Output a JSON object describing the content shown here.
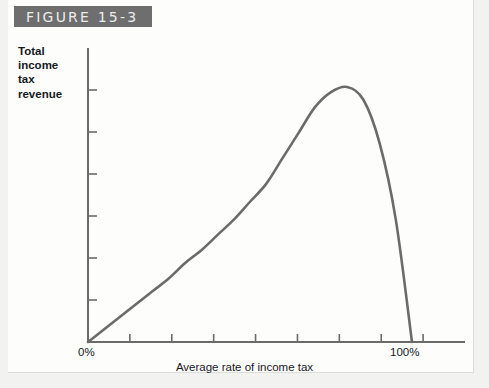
{
  "figure": {
    "banner_label": "FIGURE 15-3"
  },
  "axes": {
    "y_caption_lines": [
      "Total",
      "income",
      "tax",
      "revenue"
    ],
    "x_caption": "Average rate of income tax",
    "x_tick_labels": {
      "start": "0%",
      "end": "100%"
    }
  },
  "colors": {
    "banner_bg": "#6e6e6e",
    "banner_text": "#ececeb",
    "curve": "#6b6b6b",
    "axis": "#6b6b6b",
    "page_bg": "#f2f2f0",
    "plate_bg": "#fdfdfc",
    "text": "#15181c"
  },
  "chart_data": {
    "type": "line",
    "title": "FIGURE 15-3",
    "xlabel": "Average rate of income tax",
    "ylabel": "Total income tax revenue",
    "xlim": [
      0,
      100
    ],
    "ylim": [
      0,
      100
    ],
    "grid": false,
    "legend": null,
    "x_tick_labels": [
      "0%",
      "100%"
    ],
    "y_tick_labels": [],
    "n_x_ticks": 8,
    "n_y_ticks": 6,
    "annotations": [],
    "series": [
      {
        "name": "Total income tax revenue",
        "x": [
          0,
          5,
          10,
          15,
          20,
          25,
          30,
          35,
          40,
          45,
          50,
          55,
          60,
          65,
          70,
          75,
          80,
          85,
          90,
          95,
          100
        ],
        "y": [
          0,
          5,
          10,
          15,
          20,
          25,
          31,
          36,
          42,
          48,
          55,
          62,
          72,
          82,
          92,
          98,
          100,
          95,
          78,
          48,
          0
        ]
      }
    ]
  }
}
